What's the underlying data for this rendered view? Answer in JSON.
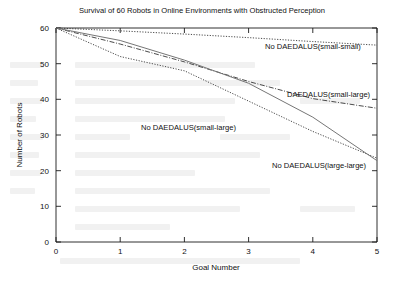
{
  "chart_data": {
    "type": "line",
    "title": "Survival of 60 Robots in Online Environments with Obstructed Perception",
    "xlabel": "Goal Number",
    "ylabel": "Number of Robots",
    "xlim": [
      0,
      5
    ],
    "ylim": [
      0,
      60
    ],
    "xticks": [
      "0",
      "1",
      "2",
      "3",
      "4",
      "5"
    ],
    "yticks": [
      "0",
      "10",
      "20",
      "30",
      "40",
      "50",
      "60"
    ],
    "grid": false,
    "legend_position": "inline-annotations",
    "x": [
      0,
      1,
      2,
      3,
      4,
      5
    ],
    "series": [
      {
        "name": "No DAEDALUS(small-small)",
        "style": "dotted",
        "values": [
          60,
          59.2,
          58.3,
          57.3,
          56.2,
          55.2
        ]
      },
      {
        "name": "DAEDALUS(small-large)",
        "style": "dash-dot",
        "values": [
          60,
          55.5,
          50.5,
          45.0,
          40.2,
          37.5
        ]
      },
      {
        "name": "No DAEDALUS(small-large)",
        "style": "dotted",
        "values": [
          60,
          52.0,
          48.0,
          39.5,
          31.0,
          23.5
        ]
      },
      {
        "name": "No DAEDALUS(large-large)",
        "style": "solid",
        "values": [
          60,
          56.5,
          51.0,
          44.5,
          35.0,
          22.8
        ]
      }
    ],
    "annotations": [
      {
        "text": "No DAEDALUS(small-small)",
        "x_px": 265,
        "y_px": 49
      },
      {
        "text": "DAEDALUS(small-large)",
        "x_px": 287,
        "y_px": 97
      },
      {
        "text": "No DAEDALUS(small-large)",
        "x_px": 141,
        "y_px": 130
      },
      {
        "text": "No DAEDALUS(large-large)",
        "x_px": 272,
        "y_px": 168
      }
    ]
  },
  "colors": {
    "axis": "#1a1a1a",
    "curve": "#2a2a2a",
    "curve_solid": "#767676",
    "background": "#ffffff"
  }
}
